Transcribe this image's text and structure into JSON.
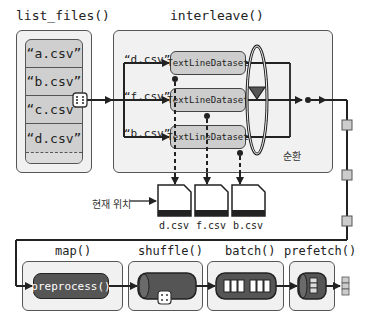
{
  "list_files": {
    "title": "list_files()",
    "items": [
      "“a.csv”",
      "“b.csv”",
      "“c.csv”",
      "“d.csv”"
    ],
    "more": "..."
  },
  "interleave": {
    "title": "interleave()",
    "inputs": [
      {
        "file": "“d.csv”",
        "dataset": "TextLineDataset"
      },
      {
        "file": "“f.csv”",
        "dataset": "TextLineDataset"
      },
      {
        "file": "“b.csv”",
        "dataset": "TextLineDataset"
      }
    ],
    "cycle_label": "순환"
  },
  "csv_files": {
    "icon_text": "CSV",
    "current_position_label": "현재 위치",
    "files": [
      "d.csv",
      "f.csv",
      "b.csv"
    ]
  },
  "pipeline": {
    "map": {
      "title": "map()",
      "op": "preprocess()"
    },
    "shuffle": {
      "title": "shuffle()"
    },
    "batch": {
      "title": "batch()"
    },
    "prefetch": {
      "title": "prefetch()"
    }
  },
  "colors": {
    "panel_bg": "#f1f1f1",
    "box_gray": "#cdcdcd",
    "dark": "#555555",
    "line": "#222222"
  }
}
